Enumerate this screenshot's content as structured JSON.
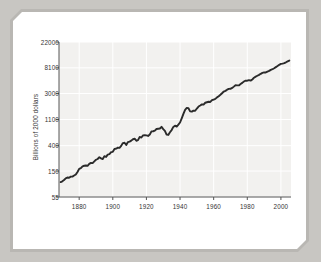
{
  "figure": {
    "background_color": "#c8c6c2",
    "frame_color": "#b9b7b3",
    "panel_color": "#ffffff",
    "plot_bg_color": "#f2f1ef",
    "gridline_color": "#ffffff",
    "axis_color": "#555555",
    "line_color": "#2b2b2b"
  },
  "chart_data": {
    "type": "line",
    "title": "",
    "subtitle": "",
    "xlabel": "",
    "ylabel": "Billions of 2000 dollars",
    "yscale": "log",
    "xscale": "linear",
    "grid": true,
    "legend": "none",
    "xlim": [
      1868,
      2006
    ],
    "ylim": [
      55,
      22000
    ],
    "ytick_labels": [
      "22000",
      "8100",
      "3000",
      "1100",
      "400",
      "150",
      "55"
    ],
    "ytick_values": [
      22000,
      8100,
      3000,
      1100,
      400,
      150,
      55
    ],
    "xtick_labels": [
      "1880",
      "1900",
      "1920",
      "1940",
      "1960",
      "1980",
      "2000"
    ],
    "xtick_values": [
      1880,
      1900,
      1920,
      1940,
      1960,
      1980,
      2000
    ],
    "series": [
      {
        "name": "Real GDP",
        "x": [
          1869,
          1870,
          1871,
          1872,
          1873,
          1874,
          1875,
          1876,
          1877,
          1878,
          1879,
          1880,
          1881,
          1882,
          1883,
          1884,
          1885,
          1886,
          1887,
          1888,
          1889,
          1890,
          1891,
          1892,
          1893,
          1894,
          1895,
          1896,
          1897,
          1898,
          1899,
          1900,
          1901,
          1902,
          1903,
          1904,
          1905,
          1906,
          1907,
          1908,
          1909,
          1910,
          1911,
          1912,
          1913,
          1914,
          1915,
          1916,
          1917,
          1918,
          1919,
          1920,
          1921,
          1922,
          1923,
          1924,
          1925,
          1926,
          1927,
          1928,
          1929,
          1930,
          1931,
          1932,
          1933,
          1934,
          1935,
          1936,
          1937,
          1938,
          1939,
          1940,
          1941,
          1942,
          1943,
          1944,
          1945,
          1946,
          1947,
          1948,
          1949,
          1950,
          1951,
          1952,
          1953,
          1954,
          1955,
          1956,
          1957,
          1958,
          1959,
          1960,
          1961,
          1962,
          1963,
          1964,
          1965,
          1966,
          1967,
          1968,
          1969,
          1970,
          1971,
          1972,
          1973,
          1974,
          1975,
          1976,
          1977,
          1978,
          1979,
          1980,
          1981,
          1982,
          1983,
          1984,
          1985,
          1986,
          1987,
          1988,
          1989,
          1990,
          1991,
          1992,
          1993,
          1994,
          1995,
          1996,
          1997,
          1998,
          1999,
          2000,
          2001,
          2002,
          2003,
          2004,
          2005
        ],
        "y": [
          98,
          101,
          106,
          113,
          117,
          116,
          121,
          121,
          126,
          131,
          145,
          163,
          168,
          180,
          184,
          186,
          184,
          198,
          206,
          204,
          218,
          232,
          239,
          256,
          245,
          238,
          266,
          259,
          283,
          288,
          311,
          315,
          351,
          356,
          371,
          368,
          397,
          442,
          448,
          411,
          460,
          468,
          486,
          513,
          523,
          484,
          496,
          561,
          548,
          596,
          601,
          596,
          582,
          614,
          695,
          698,
          714,
          761,
          768,
          776,
          829,
          757,
          707,
          615,
          606,
          672,
          731,
          826,
          867,
          835,
          902,
          980,
          1150,
          1365,
          1597,
          1720,
          1698,
          1505,
          1490,
          1552,
          1544,
          1680,
          1815,
          1888,
          1975,
          1962,
          2101,
          2144,
          2186,
          2168,
          2322,
          2382,
          2441,
          2588,
          2701,
          2857,
          3040,
          3240,
          3325,
          3486,
          3595,
          3602,
          3722,
          3919,
          4143,
          4120,
          4111,
          4332,
          4532,
          4783,
          4937,
          4924,
          5049,
          4944,
          5166,
          5537,
          5768,
          5965,
          6173,
          6430,
          6666,
          6787,
          6777,
          7012,
          7200,
          7499,
          7684,
          7976,
          8336,
          8701,
          9102,
          9463,
          9553,
          9746,
          10048,
          10430,
          10740
        ]
      }
    ],
    "annotations": []
  }
}
